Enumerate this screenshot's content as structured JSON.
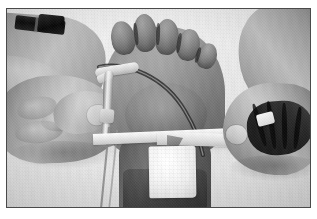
{
  "image": {
    "kind": "clinical-photograph",
    "color_mode": "grayscale",
    "orientation": "landscape",
    "width_px": 317,
    "height_px": 219,
    "caption": "",
    "alt_text": "Two hands securing an intravenous cannula on a patient's foot with adhesive tape and a white gauze dressing"
  },
  "frame": {
    "border_color": "#4a4a4a",
    "margin_color": "#ffffff",
    "inner_background": "#e9e9e7",
    "left_px": 6,
    "top_px": 8,
    "width_px": 305,
    "height_px": 200
  },
  "scene": {
    "background_label": "pale gray sheet / drape",
    "background_color": "#e9e9e6",
    "subjects": [
      {
        "name": "left-hand",
        "label": "Clinician left hand",
        "detail": "Thumb and index finger pinching the catheter hub, dark wristwatch on the forearm",
        "tone": "#b4a89d"
      },
      {
        "name": "patient-foot",
        "label": "Patient foot",
        "detail": "Plantar view, five toes visible at the top of the frame",
        "tone": "#8d8279"
      },
      {
        "name": "right-hand",
        "label": "Clinician right hand",
        "detail": "Closed fist holding a strip of adhesive tape between the fingers",
        "tone": "#a2968c"
      }
    ],
    "devices": [
      {
        "name": "iv-catheter",
        "label": "IV catheter hub",
        "color": "#f4f1ec"
      },
      {
        "name": "extension-tubing",
        "label": "Extension tubing",
        "color": "#f6f4f0"
      },
      {
        "name": "tape-strip-primary",
        "label": "Anchor tape strip",
        "color": "#fbf9f5"
      },
      {
        "name": "tape-strip-secondary",
        "label": "Chevron tape strip",
        "color": "#f6f3ee"
      },
      {
        "name": "gauze-dressing",
        "label": "Gauze dressing pad",
        "color": "#ffffff"
      },
      {
        "name": "wristwatch",
        "label": "Wristwatch",
        "color": "#121110"
      }
    ]
  }
}
